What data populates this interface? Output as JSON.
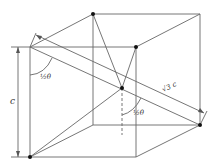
{
  "figure": {
    "type": "cube-diagram",
    "labels": {
      "edge": "c",
      "angle_upper": "½θ",
      "angle_lower": "½θ",
      "diagonal": "√3 c"
    },
    "colors": {
      "line": "#555555",
      "dot": "#111111"
    }
  }
}
